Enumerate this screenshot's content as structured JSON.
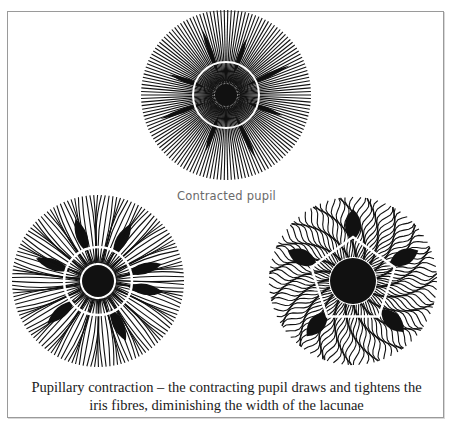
{
  "figure": {
    "label_top": "Contracted pupil",
    "caption_line1": "Pupillary contraction – the contracting pupil draws and tightens the",
    "caption_line2": "iris fibres, diminishing the width of the lacunae",
    "illustrations": [
      {
        "name": "contracted-pupil-iris",
        "style": "straight fibres, small pupil, thin lacunae"
      },
      {
        "name": "medium-pupil-iris",
        "style": "curved fibres, medium pupil, leaf-shaped lacunae"
      },
      {
        "name": "dilated-pupil-iris",
        "style": "wavy fibres, large pupil, wide lacunae"
      }
    ],
    "colors": {
      "ink": "#111111",
      "frame": "#9a9a9a",
      "label": "#6a6a6a"
    }
  }
}
